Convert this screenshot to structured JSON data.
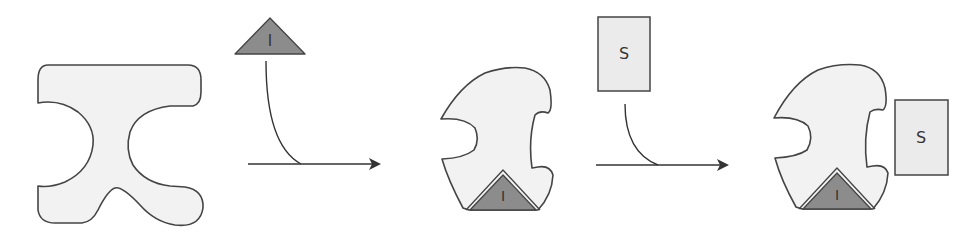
{
  "diagram": {
    "title": "",
    "stages": [
      {
        "id": "free-enzyme",
        "description": "Enzyme with open active site"
      },
      {
        "id": "enzyme-inhibitor",
        "description": "Enzyme with inhibitor bound at allosteric site; active site altered"
      },
      {
        "id": "enzyme-inhibitor-substrate",
        "description": "Substrate cannot bind the altered active site"
      }
    ],
    "inhibitor": {
      "label": "I",
      "fill": "#8c8c8c"
    },
    "substrate": {
      "label": "S",
      "fill": "#ebebeb"
    },
    "enzyme": {
      "fill": "#f2f2f2",
      "stroke": "#444444"
    },
    "arrows": [
      {
        "from": "free-enzyme",
        "to": "enzyme-inhibitor",
        "input": "I"
      },
      {
        "from": "enzyme-inhibitor",
        "to": "enzyme-inhibitor-substrate",
        "input": "S"
      }
    ]
  }
}
